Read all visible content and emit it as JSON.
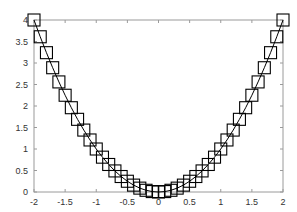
{
  "chart_data": {
    "type": "line",
    "title": "",
    "xlabel": "",
    "ylabel": "",
    "xlim": [
      -2,
      2
    ],
    "ylim": [
      0,
      4
    ],
    "grid": false,
    "legend": null,
    "x_ticks": [
      "-2",
      "-1.5",
      "-1",
      "-0.5",
      "0",
      "0.5",
      "1",
      "1.5",
      "2"
    ],
    "y_ticks": [
      "0",
      "0.5",
      "1",
      "1.5",
      "2",
      "2.5",
      "3",
      "3.5",
      "4"
    ],
    "series": [
      {
        "name": "y = x^2",
        "marker": "square",
        "line_color": "#000000",
        "marker_color": "#000000",
        "x": [
          -2.0,
          -1.9,
          -1.8,
          -1.7,
          -1.6,
          -1.5,
          -1.4,
          -1.3,
          -1.2,
          -1.1,
          -1.0,
          -0.9,
          -0.8,
          -0.7,
          -0.6,
          -0.5,
          -0.4,
          -0.3,
          -0.2,
          -0.1,
          0.0,
          0.1,
          0.2,
          0.3,
          0.4,
          0.5,
          0.6,
          0.7,
          0.8,
          0.9,
          1.0,
          1.1,
          1.2,
          1.3,
          1.4,
          1.5,
          1.6,
          1.7,
          1.8,
          1.9,
          2.0
        ],
        "values": [
          4.0,
          3.61,
          3.24,
          2.89,
          2.56,
          2.25,
          1.96,
          1.69,
          1.44,
          1.21,
          1.0,
          0.81,
          0.64,
          0.49,
          0.36,
          0.25,
          0.16,
          0.09,
          0.04,
          0.01,
          0.0,
          0.01,
          0.04,
          0.09,
          0.16,
          0.25,
          0.36,
          0.49,
          0.64,
          0.81,
          1.0,
          1.21,
          1.44,
          1.69,
          1.96,
          2.25,
          2.56,
          2.89,
          3.24,
          3.61,
          4.0
        ]
      }
    ]
  }
}
